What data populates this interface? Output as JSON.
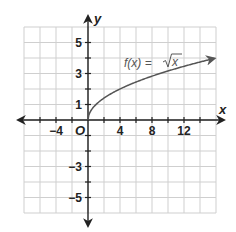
{
  "chart_data": {
    "type": "line",
    "title": "",
    "xlabel": "x",
    "ylabel": "y",
    "origin_label": "O",
    "xlim": [
      -8,
      16
    ],
    "ylim": [
      -6,
      6
    ],
    "grid": true,
    "x_ticks": [
      {
        "value": -4,
        "label": "−4"
      },
      {
        "value": 4,
        "label": "4"
      },
      {
        "value": 8,
        "label": "8"
      },
      {
        "value": 12,
        "label": "12"
      }
    ],
    "y_ticks": [
      {
        "value": 5,
        "label": "5"
      },
      {
        "value": 3,
        "label": "3"
      },
      {
        "value": 1,
        "label": "1"
      },
      {
        "value": -3,
        "label": "−3"
      },
      {
        "value": -5,
        "label": "−5"
      }
    ],
    "series": [
      {
        "name": "f(x) = √x",
        "label_prefix": "f(x) = ",
        "label_radical": "x",
        "x": [
          0,
          0.25,
          1,
          2,
          4,
          6,
          9,
          12,
          16
        ],
        "y": [
          0,
          0.5,
          1,
          1.414,
          2,
          2.449,
          3,
          3.464,
          4
        ]
      }
    ],
    "colors": {
      "curve": "#555555",
      "grid": "#cfcfcf",
      "axis": "#222222"
    }
  }
}
